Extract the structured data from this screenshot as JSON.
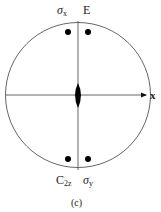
{
  "diagram": {
    "type": "stereographic-projection",
    "labels": {
      "top_left": "σx",
      "top_left_main": "σ",
      "top_left_sub": "x",
      "top_right": "E",
      "bottom_left": "C2z",
      "bottom_left_main": "C",
      "bottom_left_sub": "2z",
      "bottom_right": "σy",
      "bottom_right_main": "σ",
      "bottom_right_sub": "y",
      "axis_x": "x",
      "caption": "(c)"
    },
    "points": [
      {
        "name": "sigma-x-point",
        "x": 68,
        "y": 32
      },
      {
        "name": "e-point",
        "x": 88,
        "y": 32
      },
      {
        "name": "c2z-point",
        "x": 68,
        "y": 159
      },
      {
        "name": "sigma-y-point",
        "x": 88,
        "y": 159
      }
    ],
    "colors": {
      "line": "#555555",
      "fill": "#000000"
    }
  }
}
